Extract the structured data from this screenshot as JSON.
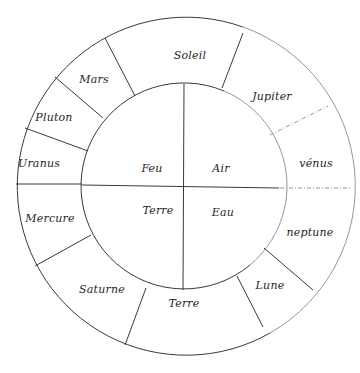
{
  "diagram": {
    "type": "concentric-circle-diagram",
    "center": [
      184,
      186
    ],
    "outer_radius": 169,
    "inner_radius": 103,
    "colors": {
      "ink": "#1e1e1e",
      "line": "#3a3a3a",
      "faint_line": "#8a8a8a",
      "background": "#ffffff"
    },
    "inner_quadrants": [
      {
        "id": "feu",
        "label": "Feu",
        "x": 152,
        "y": 168
      },
      {
        "id": "air",
        "label": "Air",
        "x": 221,
        "y": 168
      },
      {
        "id": "terre-inner",
        "label": "Terre",
        "x": 158,
        "y": 210
      },
      {
        "id": "eau",
        "label": "Eau",
        "x": 223,
        "y": 212
      }
    ],
    "outer_segments": [
      {
        "id": "soleil",
        "label": "Soleil",
        "x": 190,
        "y": 55
      },
      {
        "id": "jupiter",
        "label": "Jupiter",
        "x": 272,
        "y": 96
      },
      {
        "id": "venus",
        "label": "vénus",
        "x": 316,
        "y": 163
      },
      {
        "id": "neptune",
        "label": "neptune",
        "x": 310,
        "y": 232
      },
      {
        "id": "lune",
        "label": "Lune",
        "x": 270,
        "y": 285
      },
      {
        "id": "terre-outer",
        "label": "Terre",
        "x": 184,
        "y": 303
      },
      {
        "id": "saturne",
        "label": "Saturne",
        "x": 102,
        "y": 289
      },
      {
        "id": "mercure",
        "label": "Mercure",
        "x": 50,
        "y": 218
      },
      {
        "id": "uranus",
        "label": "Uranus",
        "x": 39,
        "y": 163
      },
      {
        "id": "pluton",
        "label": "Pluton",
        "x": 54,
        "y": 117
      },
      {
        "id": "mars",
        "label": "Mars",
        "x": 94,
        "y": 79
      }
    ],
    "dividers": [
      {
        "between": "soleil|mars",
        "x1": 135,
        "y1": 96,
        "x2": 105,
        "y2": 38,
        "style": "solid"
      },
      {
        "between": "soleil|jupiter",
        "x1": 222,
        "y1": 88,
        "x2": 243,
        "y2": 33,
        "style": "solid"
      },
      {
        "between": "jupiter|venus",
        "x1": 270,
        "y1": 135,
        "x2": 328,
        "y2": 106,
        "style": "dashed"
      },
      {
        "between": "venus|neptune",
        "x1": 280,
        "y1": 188,
        "x2": 352,
        "y2": 188,
        "style": "dashed"
      },
      {
        "between": "neptune|lune",
        "x1": 264,
        "y1": 248,
        "x2": 313,
        "y2": 290,
        "style": "solid"
      },
      {
        "between": "lune|terre",
        "x1": 237,
        "y1": 276,
        "x2": 263,
        "y2": 327,
        "style": "solid"
      },
      {
        "between": "terre|saturne",
        "x1": 146,
        "y1": 288,
        "x2": 125,
        "y2": 345,
        "style": "solid"
      },
      {
        "between": "saturne|mercure",
        "x1": 91,
        "y1": 235,
        "x2": 35,
        "y2": 266,
        "style": "solid"
      },
      {
        "between": "mercure|uranus",
        "x1": 16,
        "y1": 184,
        "x2": 82,
        "y2": 184,
        "style": "solid"
      },
      {
        "between": "uranus|pluton",
        "x1": 88,
        "y1": 151,
        "x2": 25,
        "y2": 128,
        "style": "solid"
      },
      {
        "between": "pluton|mars",
        "x1": 103,
        "y1": 118,
        "x2": 55,
        "y2": 77,
        "style": "solid"
      }
    ],
    "cross": {
      "vertical": {
        "x1": 184,
        "y1": 84,
        "x2": 183,
        "y2": 290
      },
      "horizontal": {
        "x1": 82,
        "y1": 185,
        "x2": 279,
        "y2": 188
      }
    }
  }
}
